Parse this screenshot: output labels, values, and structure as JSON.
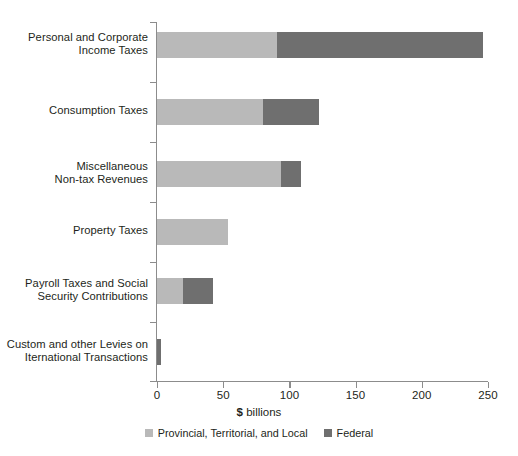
{
  "chart_data": {
    "type": "bar",
    "orientation": "horizontal",
    "stacked": true,
    "title": "",
    "xlabel": "$ billions",
    "ylabel": "",
    "xlim": [
      0,
      250
    ],
    "xticks": [
      0,
      50,
      100,
      150,
      200,
      250
    ],
    "xtick_labels": [
      "0",
      "50",
      "100",
      "150",
      "200",
      "250"
    ],
    "grid": false,
    "legend_position": "bottom",
    "categories": [
      "Personal and Corporate\nIncome Taxes",
      "Consumption Taxes",
      "Miscellaneous\nNon-tax Revenues",
      "Property Taxes",
      "Payroll Taxes and Social\nSecurity Contributions",
      "Custom and other Levies on\nIternational Transactions"
    ],
    "series": [
      {
        "name": "Provincial, Territorial, and Local",
        "color": "#b9b9b9",
        "values": [
          91,
          80,
          94,
          54,
          20,
          0
        ]
      },
      {
        "name": "Federal",
        "color": "#6f6f6f",
        "values": [
          155,
          42,
          15,
          0,
          22,
          3
        ]
      }
    ],
    "totals": [
      246,
      122,
      109,
      54,
      42,
      3
    ]
  },
  "axis": {
    "x_title_prefix": "$",
    "x_title_suffix": " billions"
  },
  "legend": {
    "items": [
      {
        "label": "Provincial, Territorial, and Local",
        "color": "#b9b9b9"
      },
      {
        "label": "Federal",
        "color": "#6f6f6f"
      }
    ]
  },
  "colors": {
    "provincial": "#b9b9b9",
    "federal": "#6f6f6f",
    "axis": "#8c8c8c",
    "text": "#231f20",
    "background": "#ffffff"
  }
}
